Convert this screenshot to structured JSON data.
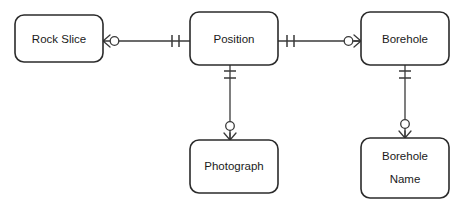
{
  "diagram": {
    "type": "entity-relationship-diagram",
    "notation": "crow's foot",
    "background_color": "#ffffff",
    "line_color": "#3a3a3a",
    "box_stroke_color": "#2b2b2b",
    "text_color": "#1a1a1a"
  },
  "entities": [
    {
      "id": "rock-slice",
      "label": "Rock Slice",
      "label_lines": [
        "Rock Slice"
      ],
      "x": 15,
      "y": 15,
      "width": 88,
      "height": 47
    },
    {
      "id": "position",
      "label": "Position",
      "label_lines": [
        "Position"
      ],
      "x": 190,
      "y": 12,
      "width": 88,
      "height": 53
    },
    {
      "id": "borehole",
      "label": "Borehole",
      "label_lines": [
        "Borehole"
      ],
      "x": 361,
      "y": 12,
      "width": 88,
      "height": 53
    },
    {
      "id": "photograph",
      "label": "Photograph",
      "label_lines": [
        "Photograph"
      ],
      "x": 190,
      "y": 140,
      "width": 88,
      "height": 53
    },
    {
      "id": "borehole-name",
      "label": "Borehole Name",
      "label_lines": [
        "Borehole",
        "Name"
      ],
      "x": 361,
      "y": 138,
      "width": 88,
      "height": 60
    }
  ],
  "relationships": [
    {
      "id": "rel-rockslice-position",
      "from": "rock-slice",
      "to": "position",
      "orientation": "horizontal",
      "from_cardinality": "zero-or-many",
      "to_cardinality": "exactly-one"
    },
    {
      "id": "rel-position-borehole",
      "from": "position",
      "to": "borehole",
      "orientation": "horizontal",
      "from_cardinality": "exactly-one",
      "to_cardinality": "zero-or-many"
    },
    {
      "id": "rel-position-photograph",
      "from": "position",
      "to": "photograph",
      "orientation": "vertical",
      "from_cardinality": "exactly-one",
      "to_cardinality": "zero-or-many"
    },
    {
      "id": "rel-borehole-boreholename",
      "from": "borehole",
      "to": "borehole-name",
      "orientation": "vertical",
      "from_cardinality": "exactly-one",
      "to_cardinality": "zero-or-many"
    }
  ]
}
